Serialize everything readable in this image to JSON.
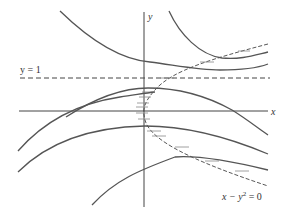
{
  "figure": {
    "axes": {
      "x_label": "x",
      "y_label": "y"
    },
    "asymptote": {
      "label": "y = 1",
      "style": "dashed"
    },
    "nullcline": {
      "label_parts": [
        "x − y",
        "2",
        " = 0"
      ],
      "equation": "x - y^2 = 0",
      "style": "dashed with horizontal tangent marks"
    },
    "colors": {
      "curve": "#555555",
      "axis": "#444444",
      "background": "#ffffff"
    },
    "solution_curve_count": 6
  }
}
